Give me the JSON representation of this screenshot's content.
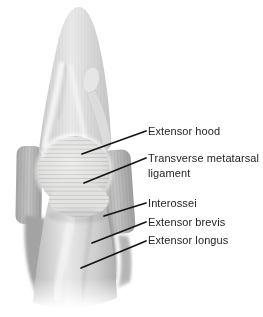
{
  "background": "#ffffff",
  "diagram": {
    "labels": [
      {
        "text": "Extensor hood",
        "x": 148,
        "y": 124,
        "line": [
          146,
          131,
          82,
          154
        ]
      },
      {
        "text": "Transverse metatarsal ligament",
        "x": 148,
        "y": 151,
        "max_width_px": 114,
        "line": [
          146,
          158,
          84,
          183
        ]
      },
      {
        "text": "Interossei",
        "x": 148,
        "y": 196,
        "line": [
          146,
          203,
          104,
          216
        ]
      },
      {
        "text": "Extensor brevis",
        "x": 148,
        "y": 215,
        "line": [
          146,
          222,
          92,
          243
        ]
      },
      {
        "text": "Extensor longus",
        "x": 148,
        "y": 233,
        "line": [
          146,
          241,
          81,
          268
        ]
      }
    ],
    "label_style": {
      "font_size_px": 11,
      "color": "#242424"
    },
    "leader_line": {
      "color": "#141414",
      "width_px": 1.7
    }
  }
}
